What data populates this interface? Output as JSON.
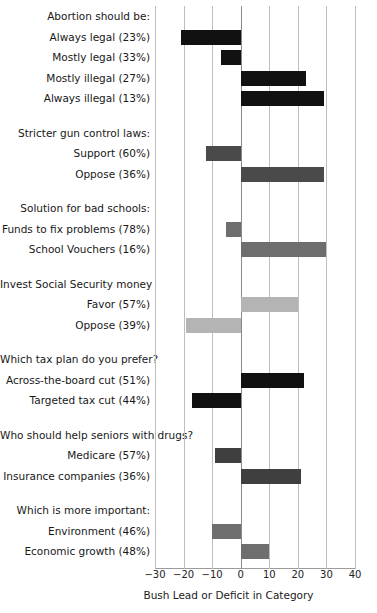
{
  "chart_data": {
    "type": "bar",
    "title": "",
    "subtitle": "",
    "xlabel": "Bush Lead or Deficit in Category",
    "ylabel": "",
    "xlim": [
      -30,
      40
    ],
    "xticks": [
      -30,
      -20,
      -10,
      0,
      10,
      20,
      30,
      40
    ],
    "xticklabels": [
      "-30",
      "-20",
      "-10",
      "0",
      "10",
      "20",
      "30",
      "40"
    ],
    "orientation": "horizontal",
    "grid": "vertical",
    "legend": "none",
    "zero_reference_line": 0,
    "groups": [
      {
        "header": "Abortion should be:",
        "items": [
          {
            "label": "Always legal (23%)",
            "value": -21,
            "color": "#111111"
          },
          {
            "label": "Mostly legal (33%)",
            "value": -7,
            "color": "#111111"
          },
          {
            "label": "Mostly illegal (27%)",
            "value": 23,
            "color": "#111111"
          },
          {
            "label": "Always illegal (13%)",
            "value": 29,
            "color": "#111111"
          }
        ]
      },
      {
        "header": "Stricter gun control laws:",
        "items": [
          {
            "label": "Support (60%)",
            "value": -12,
            "color": "#4a4a4a"
          },
          {
            "label": "Oppose (36%)",
            "value": 29,
            "color": "#4a4a4a"
          }
        ]
      },
      {
        "header": "Solution for bad schools:",
        "items": [
          {
            "label": "Funds to fix problems (78%)",
            "value": -5,
            "color": "#6e6e6e"
          },
          {
            "label": "School Vouchers (16%)",
            "value": 30,
            "color": "#6e6e6e"
          }
        ]
      },
      {
        "header": "Invest Social Security money",
        "items": [
          {
            "label": "Favor (57%)",
            "value": 20,
            "color": "#b4b4b4"
          },
          {
            "label": "Oppose (39%)",
            "value": -19,
            "color": "#b4b4b4"
          }
        ]
      },
      {
        "header": "Which tax plan do you prefer?",
        "items": [
          {
            "label": "Across-the-board cut (51%)",
            "value": 22,
            "color": "#111111"
          },
          {
            "label": "Targeted tax cut (44%)",
            "value": -17,
            "color": "#111111"
          }
        ]
      },
      {
        "header": "Who should help seniors with drugs?",
        "items": [
          {
            "label": "Medicare (57%)",
            "value": -9,
            "color": "#3f3f3f"
          },
          {
            "label": "Insurance companies (36%)",
            "value": 21,
            "color": "#3f3f3f"
          }
        ]
      },
      {
        "header": "Which is more important:",
        "items": [
          {
            "label": "Environment (46%)",
            "value": -10,
            "color": "#6e6e6e"
          },
          {
            "label": "Economic growth (48%)",
            "value": 10,
            "color": "#6e6e6e"
          }
        ]
      }
    ]
  }
}
